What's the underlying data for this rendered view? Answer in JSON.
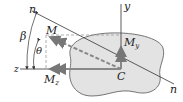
{
  "diagram": {
    "labels": {
      "n_top": "n",
      "n_bottom": "n",
      "y_axis": "y",
      "z_axis": "z",
      "moment": "M",
      "my_main": "M",
      "my_sub": "y",
      "mz_main": "M",
      "mz_sub": "z",
      "centroid": "C",
      "beta": "β",
      "theta": "θ"
    },
    "colors": {
      "section_fill": "#e3e3e3",
      "section_stroke": "#555555",
      "line": "#333333",
      "vector": "#888888"
    }
  }
}
